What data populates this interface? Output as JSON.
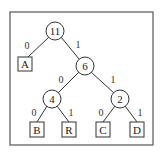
{
  "diagram": {
    "type": "huffman-tree",
    "nodes": {
      "root": {
        "label": "11"
      },
      "n6": {
        "label": "6"
      },
      "n4": {
        "label": "4"
      },
      "n2": {
        "label": "2"
      }
    },
    "leaves": {
      "A": {
        "label": "A"
      },
      "B": {
        "label": "B"
      },
      "R": {
        "label": "R"
      },
      "C": {
        "label": "C"
      },
      "D": {
        "label": "D"
      }
    },
    "edges": {
      "root_A": {
        "label": "0"
      },
      "root_n6": {
        "label": "1"
      },
      "n6_n4": {
        "label": "0"
      },
      "n6_n2": {
        "label": "1"
      },
      "n4_B": {
        "label": "0"
      },
      "n4_R": {
        "label": "1"
      },
      "n2_C": {
        "label": "0"
      },
      "n2_D": {
        "label": "1"
      }
    }
  }
}
